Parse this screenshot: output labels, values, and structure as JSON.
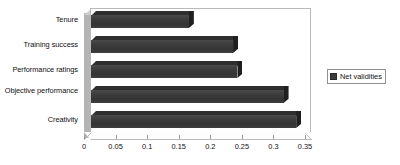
{
  "chart_data": {
    "type": "bar",
    "orientation": "horizontal",
    "title": "",
    "xlabel": "",
    "ylabel": "",
    "categories": [
      "Creativity",
      "Objective performance",
      "Performance ratings",
      "Training success",
      "Tenure"
    ],
    "series": [
      {
        "name": "Net validities",
        "values": [
          0.325,
          0.305,
          0.232,
          0.225,
          0.155
        ]
      }
    ],
    "xlim": [
      0,
      0.35
    ],
    "xticks": [
      0,
      0.05,
      0.1,
      0.15,
      0.2,
      0.25,
      0.3,
      0.35
    ],
    "xtick_labels": [
      "0",
      "0.05",
      "0.1",
      "0.15",
      "0.2",
      "0.25",
      "0.3",
      "0.35"
    ],
    "grid": false,
    "style": "3d-bar",
    "bar_color": "#3b3b3b",
    "plot_border_color": "#b9b9b9",
    "wall_color": "#b4b4b4"
  },
  "legend": {
    "position": "right",
    "entries": [
      {
        "label": "Net validities",
        "color": "#3b3b3b"
      }
    ]
  }
}
